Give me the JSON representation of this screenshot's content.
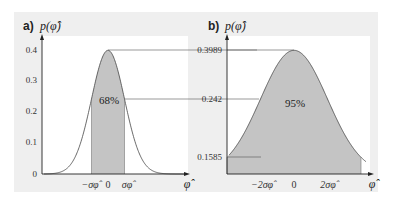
{
  "chart_data": [
    {
      "type": "area",
      "panel": "a",
      "title": "a) p(φ̂)",
      "ylabel": "p(φ̂)",
      "xlabel": "φ̂",
      "distribution": "standard normal density",
      "yticks": [
        0,
        0.1,
        0.2,
        0.3,
        0.4
      ],
      "ylim": [
        0,
        0.42
      ],
      "xtick_labels": [
        "−σφ̂",
        "0",
        "σφ̂"
      ],
      "shaded_region": {
        "from": "−σ",
        "to": "σ",
        "label": "68%",
        "fraction": 0.68
      },
      "reference_lines": [
        {
          "value": 0.3989,
          "description": "peak height"
        },
        {
          "value": 0.242,
          "description": "density at ±σ"
        }
      ],
      "grid": false
    },
    {
      "type": "area",
      "panel": "b",
      "title": "b) p(φ̂)",
      "ylabel": "p(φ̂)",
      "xlabel": "φ̂",
      "distribution": "standard normal density",
      "ytick_labels": [
        "0.3989",
        "0.242",
        "0.1585"
      ],
      "xtick_labels": [
        "−2σφ̂",
        "0",
        "2σφ̂"
      ],
      "shaded_region": {
        "from": "−2σ",
        "to": "2σ",
        "label": "95%",
        "fraction": 0.95
      },
      "reference_lines": [
        {
          "value": 0.3989
        },
        {
          "value": 0.242
        },
        {
          "value": 0.1585
        }
      ],
      "grid": false
    }
  ],
  "panel_a": {
    "label": "a)",
    "ylabel": "p(φ̂)",
    "xlabel": "φ̂",
    "yticks": [
      "0.4",
      "0.3",
      "0.2",
      "0.1",
      "0"
    ],
    "xticks": [
      "−σφ̂",
      "0",
      "σφ̂"
    ],
    "shaded_label": "68%"
  },
  "panel_b": {
    "label": "b)",
    "ylabel": "p(φ̂)",
    "xlabel": "φ̂",
    "yticks": [
      "0.3989",
      "0.242",
      "0.1585"
    ],
    "xticks": [
      "−2σφ̂",
      "0",
      "2σφ̂"
    ],
    "shaded_label": "95%"
  },
  "colors": {
    "background_panel": "#efefef",
    "plot_area": "#ffffff",
    "shade": "#c4c4c4",
    "curve": "#444444",
    "axes": "#222222"
  }
}
